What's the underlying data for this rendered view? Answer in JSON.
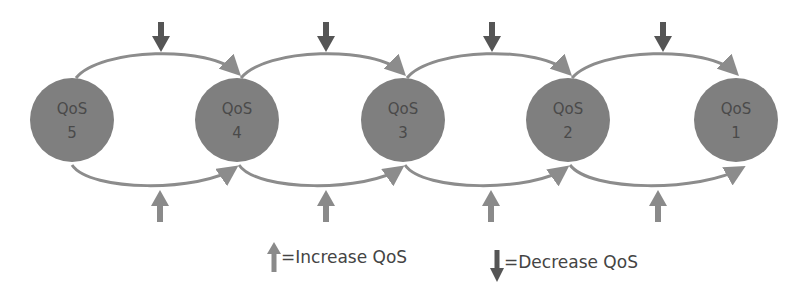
{
  "diagram": {
    "type": "state-transition",
    "colors": {
      "node_fill": "#7f7f7f",
      "edge": "#8c8c8c",
      "decrease_arrow": "#555555",
      "increase_arrow": "#8a8a8a",
      "text": "#4a4a4a"
    },
    "nodes": [
      {
        "id": "qos5",
        "line1": "QoS",
        "line2": "5",
        "cx": 72
      },
      {
        "id": "qos4",
        "line1": "QoS",
        "line2": "4",
        "cx": 237
      },
      {
        "id": "qos3",
        "line1": "QoS",
        "line2": "3",
        "cx": 403
      },
      {
        "id": "qos2",
        "line1": "QoS",
        "line2": "2",
        "cx": 568
      },
      {
        "id": "qos1",
        "line1": "QoS",
        "line2": "1",
        "cx": 735
      }
    ],
    "edges": [
      {
        "from": "qos5",
        "to": "qos4",
        "label": "decrease",
        "side": "top"
      },
      {
        "from": "qos4",
        "to": "qos3",
        "label": "decrease",
        "side": "top"
      },
      {
        "from": "qos3",
        "to": "qos2",
        "label": "decrease",
        "side": "top"
      },
      {
        "from": "qos2",
        "to": "qos1",
        "label": "decrease",
        "side": "top"
      },
      {
        "from": "qos5",
        "to": "qos4",
        "label": "increase",
        "side": "bottom"
      },
      {
        "from": "qos4",
        "to": "qos3",
        "label": "increase",
        "side": "bottom"
      },
      {
        "from": "qos3",
        "to": "qos2",
        "label": "increase",
        "side": "bottom"
      },
      {
        "from": "qos2",
        "to": "qos1",
        "label": "increase",
        "side": "bottom"
      }
    ]
  },
  "legend": {
    "increase": "=Increase QoS",
    "decrease": "=Decrease QoS"
  }
}
